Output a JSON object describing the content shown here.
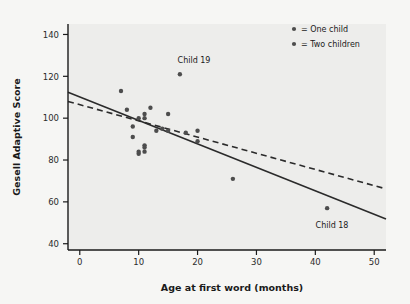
{
  "chart_data": {
    "type": "scatter",
    "title": "",
    "xlabel": "Age at first word (months)",
    "ylabel": "Gesell Adaptive Score",
    "xlim": [
      -2,
      52
    ],
    "ylim": [
      37,
      145
    ],
    "xticks": [
      0,
      10,
      20,
      30,
      40,
      50
    ],
    "yticks": [
      40,
      60,
      80,
      100,
      120,
      140
    ],
    "grid": false,
    "legend_position": "top-right",
    "legend": [
      {
        "label": "= One child",
        "marker": "dot",
        "color": "#555555"
      },
      {
        "label": "= Two children",
        "marker": "dot",
        "color": "#555555"
      }
    ],
    "series": [
      {
        "name": "Children",
        "marker_color": "#4d4d4d",
        "points": [
          {
            "x": 7,
            "y": 113
          },
          {
            "x": 8,
            "y": 104
          },
          {
            "x": 9,
            "y": 96
          },
          {
            "x": 9,
            "y": 91
          },
          {
            "x": 10,
            "y": 83
          },
          {
            "x": 10,
            "y": 84
          },
          {
            "x": 10,
            "y": 100
          },
          {
            "x": 11,
            "y": 102
          },
          {
            "x": 11,
            "y": 100
          },
          {
            "x": 11,
            "y": 87
          },
          {
            "x": 11,
            "y": 86
          },
          {
            "x": 11,
            "y": 84
          },
          {
            "x": 12,
            "y": 105
          },
          {
            "x": 13,
            "y": 94
          },
          {
            "x": 14,
            "y": 95
          },
          {
            "x": 15,
            "y": 102
          },
          {
            "x": 15,
            "y": 94
          },
          {
            "x": 17,
            "y": 121
          },
          {
            "x": 18,
            "y": 93
          },
          {
            "x": 20,
            "y": 94
          },
          {
            "x": 20,
            "y": 89
          },
          {
            "x": 26,
            "y": 71
          },
          {
            "x": 42,
            "y": 57
          }
        ]
      }
    ],
    "lines": [
      {
        "name": "regression-all-points",
        "style": "solid",
        "color": "#2b2b2b",
        "x1": -2,
        "y1": 112.4,
        "x2": 52,
        "y2": 51.8
      },
      {
        "name": "regression-excluding-child-18",
        "style": "dashed",
        "color": "#2b2b2b",
        "x1": -2,
        "y1": 108.0,
        "x2": 52,
        "y2": 66.2
      }
    ],
    "annotations": [
      {
        "label": "Child 19",
        "x": 17,
        "y": 121,
        "position": "above"
      },
      {
        "label": "Child 18",
        "x": 42,
        "y": 57,
        "position": "below"
      }
    ]
  },
  "axes": {
    "x_label": "Age at first word (months)",
    "y_label": "Gesell Adaptive Score",
    "x_tick_labels": [
      "0",
      "10",
      "20",
      "30",
      "40",
      "50"
    ],
    "y_tick_labels": [
      "40",
      "60",
      "80",
      "100",
      "120",
      "140"
    ]
  },
  "legend": {
    "items": [
      {
        "label": "= One child"
      },
      {
        "label": "= Two children"
      }
    ]
  },
  "annotations": {
    "child19": "Child 19",
    "child18": "Child 18"
  },
  "colors": {
    "marker": "#4d4d4d",
    "line": "#2b2b2b",
    "plot_background": "#ededeb",
    "figure_background": "#f6f6f4",
    "axis": "#1a1a1a"
  }
}
